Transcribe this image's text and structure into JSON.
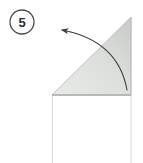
{
  "figure": {
    "background_color": "#ffffff",
    "width": 143,
    "height": 163
  },
  "step_badge": {
    "label": "5",
    "name": "step-number-5",
    "circle_center_x": 22,
    "circle_center_y": 22,
    "circle_radius": 12,
    "stroke_color": "#4d4d4d",
    "text_color": "#2b2b2b"
  },
  "paper": {
    "sheet": {
      "label": "paper-sheet-body",
      "fill_color": "#ffffff",
      "stroke_color": "#d3d3d3",
      "left": 52,
      "top": 95,
      "right": 131,
      "bottom": 163
    },
    "flap": {
      "label": "folded-triangle-flap",
      "fill_light": "#e4e6e4",
      "fill_dark": "#c9ccc9",
      "stroke_color": "#b9bcb9",
      "apex_x": 131,
      "apex_y": 17,
      "bottom_left_x": 52,
      "bottom_left_y": 95,
      "bottom_right_x": 131,
      "bottom_right_y": 95
    },
    "fold_edge": {
      "label": "fold-crease-line",
      "stroke_color": "#9b9e9b"
    }
  },
  "arrow": {
    "label": "fold-direction-arrow",
    "stroke_color": "#3c3c3c",
    "head_x": 60,
    "head_y": 30,
    "tail_x": 127,
    "tail_y": 90,
    "direction": "up-left"
  },
  "colors": {
    "accent": "#4d4d4d",
    "paper_gray": "#d5d7d5",
    "line": "#3c3c3c"
  }
}
